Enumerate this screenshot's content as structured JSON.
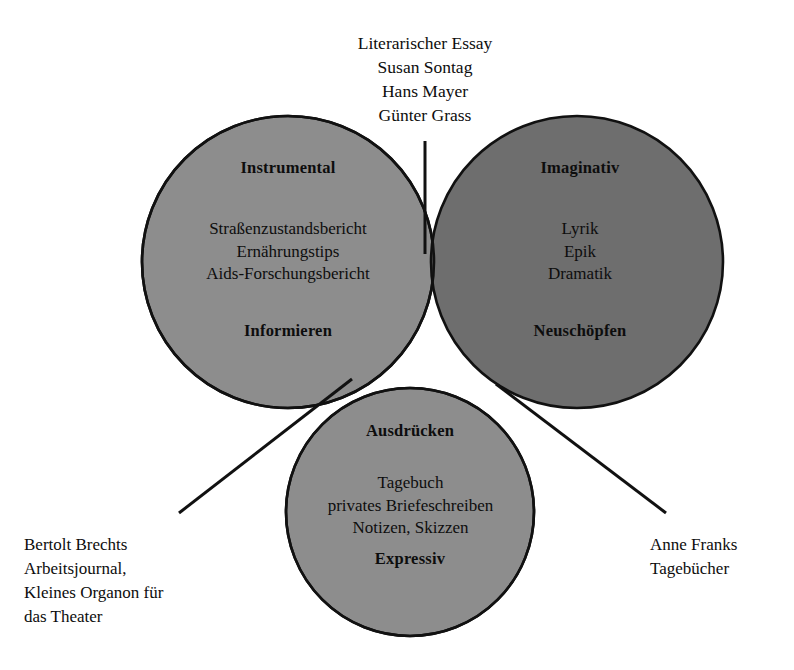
{
  "figure": {
    "type": "venn-diagram",
    "sets": 3,
    "colors": {
      "circle_light": "#8d8d8d",
      "circle_dark": "#6e6e6e",
      "outline": "#111111",
      "background": "#ffffff",
      "text": "#0d0d0d"
    }
  },
  "annotations": {
    "top": {
      "name": "literarischer-essay-note",
      "lines": [
        "Literarischer Essay",
        "Susan Sontag",
        "Hans Mayer",
        "Günter Grass"
      ],
      "leader": "vertical line into instrumental/imaginativ overlap"
    },
    "bottom_left": {
      "name": "bertolt-brecht-note",
      "lines": [
        "Bertolt Brechts",
        "Arbeitsjournal,",
        "Kleines Organon für",
        "das Theater"
      ],
      "leader": "diagonal line into instrumental/expressiv overlap"
    },
    "bottom_right": {
      "name": "anne-frank-note",
      "lines": [
        "Anne Franks",
        "Tagebücher"
      ],
      "leader": "diagonal line into imaginativ/expressiv overlap"
    }
  },
  "circles": {
    "instrumental": {
      "title": "Instrumental",
      "function": "Informieren",
      "items": [
        "Straßenzustandsbericht",
        "Ernährungstips",
        "Aids-Forschungsbericht"
      ],
      "fill": "#8d8d8d",
      "cx": 288,
      "cy": 262,
      "r": 146
    },
    "imaginativ": {
      "title": "Imaginativ",
      "function": "Neuschöpfen",
      "items": [
        "Lyrik",
        "Epik",
        "Dramatik"
      ],
      "fill": "#6e6e6e",
      "cx": 577,
      "cy": 262,
      "r": 146
    },
    "expressiv": {
      "title": "Ausdrücken",
      "function": "Expressiv",
      "items": [
        "Tagebuch",
        "privates Briefeschreiben",
        "Notizen, Skizzen"
      ],
      "fill": "#8d8d8d",
      "cx": 410,
      "cy": 512,
      "r": 124
    }
  },
  "text_blocks": {
    "top_note": "Literarischer Essay\nSusan Sontag\nHans Mayer\nGünter Grass",
    "instrumental_title": "Instrumental",
    "instrumental_items": "Straßenzustandsbericht\nErnährungstips\nAids-Forschungsbericht",
    "instrumental_function": "Informieren",
    "imaginativ_title": "Imaginativ",
    "imaginativ_items": "Lyrik\nEpik\nDramatik",
    "imaginativ_function": "Neuschöpfen",
    "expressiv_title": "Ausdrücken",
    "expressiv_items": "Tagebuch\nprivates Briefeschreiben\nNotizen, Skizzen",
    "expressiv_function": "Expressiv",
    "caption_left": "Bertolt Brechts\nArbeitsjournal,\nKleines Organon für\ndas Theater",
    "caption_right": "Anne Franks\nTagebücher"
  }
}
